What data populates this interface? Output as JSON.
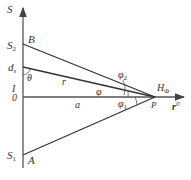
{
  "diagram": {
    "axis_vertical_label": "S",
    "axis_horizontal_label": "r",
    "axis_horizontal_label_sup": "0",
    "origin_label": "0",
    "current_label": "I",
    "points": {
      "S2": "S",
      "S2_sub": "2",
      "S1": "S",
      "S1_sub": "1",
      "B": "B",
      "A": "A",
      "P": "P",
      "ds": "d",
      "ds_sub": "s"
    },
    "segments": {
      "r": "r",
      "a": "a"
    },
    "angles": {
      "theta": "θ",
      "phi": "φ",
      "phi1": "φ",
      "phi1_sub": "1",
      "phi2": "φ",
      "phi2_sub": "2"
    },
    "field_label": "H",
    "field_sub": "Φ"
  }
}
